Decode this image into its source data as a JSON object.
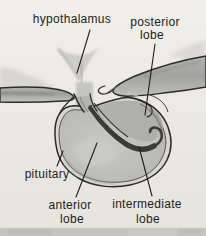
{
  "diagram": {
    "labels": {
      "hypothalamus": "hypothalamus",
      "posterior": {
        "line1": "posterior",
        "line2": "lobe"
      },
      "pituitary": "pituitary",
      "anterior": {
        "line1": "anterior",
        "line2": "lobe"
      },
      "intermediate": {
        "line1": "intermediate",
        "line2": "lobe"
      }
    },
    "colors": {
      "paper": "#ece9e4",
      "ink": "#2b2b29",
      "label_text": "#1d1d1b",
      "band_gray": "#a5a5a1",
      "capsule_ring": "#d8d7d2",
      "anterior_lobe_fill": "#bfbfbb",
      "posterior_lobe_fill": "#afafab",
      "intermediate_lobe_dark": "#3a3a36",
      "bottom_strip": "#c5c5be"
    }
  }
}
